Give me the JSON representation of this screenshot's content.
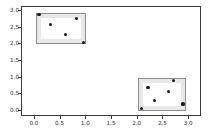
{
  "chart_data": {
    "type": "scatter",
    "title": "",
    "xlabel": "",
    "ylabel": "",
    "xlim": [
      -0.25,
      3.25
    ],
    "ylim": [
      -0.18,
      3.12
    ],
    "grid": false,
    "legend": null,
    "xticks": [
      "0.0",
      "0.5",
      "1.0",
      "1.5",
      "2.0",
      "2.5",
      "3.0"
    ],
    "xtick_values": [
      0.0,
      0.5,
      1.0,
      1.5,
      2.0,
      2.5,
      3.0
    ],
    "yticks": [
      "0.0",
      "0.5",
      "1.0",
      "1.5",
      "2.0",
      "2.5",
      "3.0"
    ],
    "ytick_values": [
      0.0,
      0.5,
      1.0,
      1.5,
      2.0,
      2.5,
      3.0
    ],
    "series": [
      {
        "name": "cluster-1",
        "marker": "circle",
        "color": "#1a1a1a",
        "points": [
          {
            "x": 0.08,
            "y": 2.89
          },
          {
            "x": 0.31,
            "y": 2.59
          },
          {
            "x": 0.6,
            "y": 2.29
          },
          {
            "x": 0.81,
            "y": 2.78
          },
          {
            "x": 0.94,
            "y": 2.06
          }
        ]
      },
      {
        "name": "cluster-2",
        "marker": "circle",
        "color": "#1a1a1a",
        "points": [
          {
            "x": 2.07,
            "y": 0.07
          },
          {
            "x": 2.2,
            "y": 0.7
          },
          {
            "x": 2.32,
            "y": 0.31
          },
          {
            "x": 2.6,
            "y": 0.59
          },
          {
            "x": 2.69,
            "y": 0.92
          },
          {
            "x": 2.88,
            "y": 0.21
          }
        ]
      }
    ],
    "boxes": [
      {
        "name": "cluster-1-bounds",
        "x0": 0.02,
        "x1": 1.0,
        "y0": 2.0,
        "y1": 2.95,
        "facecolor": "#969696",
        "edgecolor": "#8d8d8d",
        "alpha": 0.22
      },
      {
        "name": "cluster-2-bounds",
        "x0": 2.01,
        "x1": 2.94,
        "y0": 0.01,
        "y1": 0.98,
        "facecolor": "#969696",
        "edgecolor": "#8d8d8d",
        "alpha": 0.22
      }
    ]
  }
}
